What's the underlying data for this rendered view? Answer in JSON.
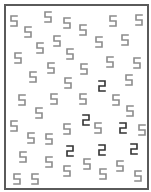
{
  "stimulus": {
    "type": "visual-search",
    "distractor_digit": "5",
    "target_digit": "2",
    "colors": {
      "background": "#ffffff",
      "frame": "#5a5a5a",
      "distractor": "#8c8c8c",
      "target": "#333333"
    },
    "glyphs": [
      {
        "d": "5",
        "x": 10,
        "y": 15
      },
      {
        "d": "5",
        "x": 44,
        "y": 11
      },
      {
        "d": "5",
        "x": 63,
        "y": 17
      },
      {
        "d": "5",
        "x": 79,
        "y": 24
      },
      {
        "d": "5",
        "x": 109,
        "y": 15
      },
      {
        "d": "5",
        "x": 135,
        "y": 14
      },
      {
        "d": "5",
        "x": 24,
        "y": 26
      },
      {
        "d": "5",
        "x": 53,
        "y": 35
      },
      {
        "d": "5",
        "x": 95,
        "y": 36
      },
      {
        "d": "5",
        "x": 121,
        "y": 34
      },
      {
        "d": "5",
        "x": 36,
        "y": 42
      },
      {
        "d": "5",
        "x": 66,
        "y": 48
      },
      {
        "d": "5",
        "x": 14,
        "y": 52
      },
      {
        "d": "5",
        "x": 106,
        "y": 56
      },
      {
        "d": "5",
        "x": 133,
        "y": 57
      },
      {
        "d": "5",
        "x": 47,
        "y": 62
      },
      {
        "d": "5",
        "x": 80,
        "y": 63
      },
      {
        "d": "5",
        "x": 29,
        "y": 71
      },
      {
        "d": "5",
        "x": 64,
        "y": 77
      },
      {
        "d": "2",
        "x": 98,
        "y": 80
      },
      {
        "d": "5",
        "x": 125,
        "y": 74
      },
      {
        "d": "5",
        "x": 18,
        "y": 94
      },
      {
        "d": "5",
        "x": 50,
        "y": 93
      },
      {
        "d": "5",
        "x": 79,
        "y": 93
      },
      {
        "d": "5",
        "x": 112,
        "y": 94
      },
      {
        "d": "5",
        "x": 35,
        "y": 107
      },
      {
        "d": "5",
        "x": 126,
        "y": 105
      },
      {
        "d": "5",
        "x": 10,
        "y": 120
      },
      {
        "d": "2",
        "x": 82,
        "y": 114
      },
      {
        "d": "5",
        "x": 94,
        "y": 122
      },
      {
        "d": "2",
        "x": 119,
        "y": 122
      },
      {
        "d": "5",
        "x": 138,
        "y": 124
      },
      {
        "d": "5",
        "x": 63,
        "y": 123
      },
      {
        "d": "5",
        "x": 27,
        "y": 132
      },
      {
        "d": "5",
        "x": 45,
        "y": 133
      },
      {
        "d": "2",
        "x": 66,
        "y": 145
      },
      {
        "d": "2",
        "x": 98,
        "y": 144
      },
      {
        "d": "2",
        "x": 130,
        "y": 143
      },
      {
        "d": "5",
        "x": 19,
        "y": 151
      },
      {
        "d": "5",
        "x": 45,
        "y": 156
      },
      {
        "d": "5",
        "x": 83,
        "y": 158
      },
      {
        "d": "5",
        "x": 116,
        "y": 160
      },
      {
        "d": "5",
        "x": 63,
        "y": 165
      },
      {
        "d": "5",
        "x": 99,
        "y": 168
      },
      {
        "d": "5",
        "x": 13,
        "y": 173
      },
      {
        "d": "5",
        "x": 31,
        "y": 173
      },
      {
        "d": "5",
        "x": 134,
        "y": 170
      }
    ]
  }
}
